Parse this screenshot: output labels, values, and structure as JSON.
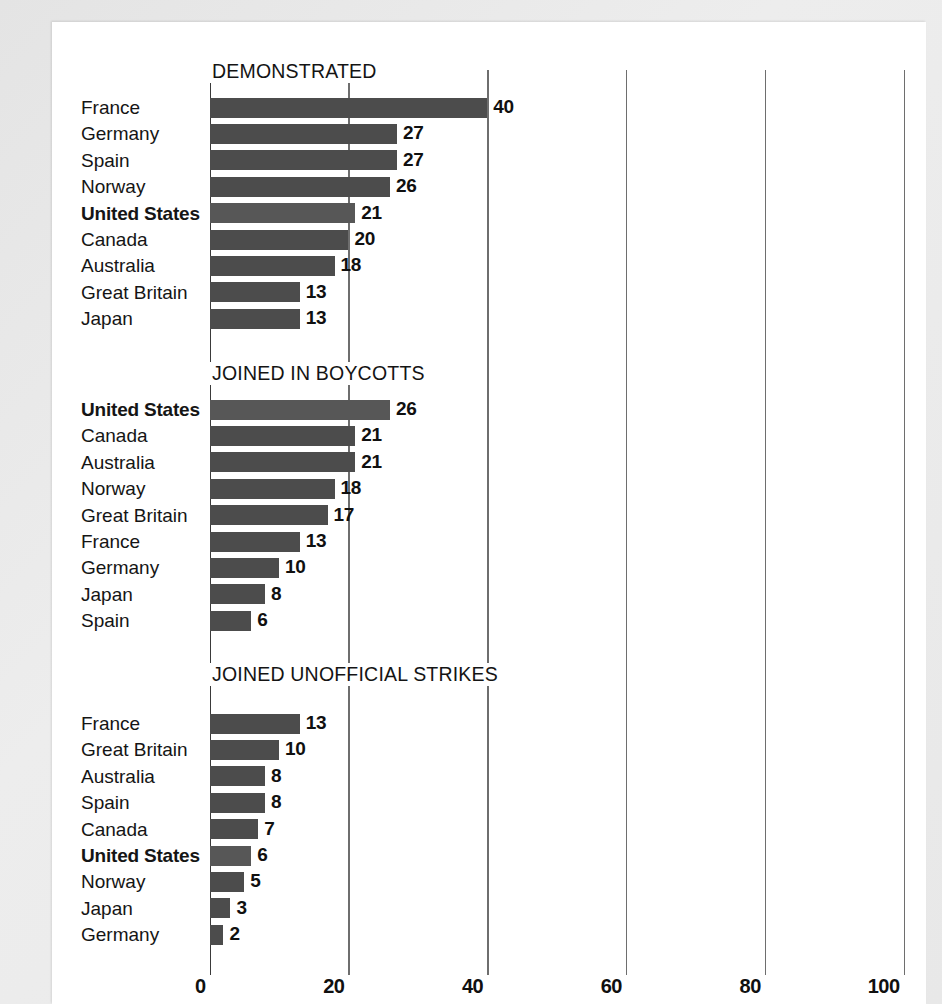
{
  "chart_data": {
    "type": "bar",
    "orientation": "horizontal",
    "title": "",
    "xlabel": "",
    "ylabel": "",
    "xlim": [
      0,
      100
    ],
    "xticks": [
      0,
      20,
      40,
      60,
      80,
      100
    ],
    "xtick_labels": [
      "0",
      "20",
      "40",
      "60",
      "80",
      "100"
    ],
    "grid": true,
    "legend": "none",
    "highlight_category": "United States",
    "bar_color": "#4c4c4c",
    "highlight_bar_color": "#575757",
    "panels": [
      {
        "title": "DEMONSTRATED",
        "categories": [
          "France",
          "Germany",
          "Spain",
          "Norway",
          "United States",
          "Canada",
          "Australia",
          "Great Britain",
          "Japan"
        ],
        "values": [
          40,
          27,
          27,
          26,
          21,
          20,
          18,
          13,
          13
        ]
      },
      {
        "title": "JOINED IN BOYCOTTS",
        "categories": [
          "United States",
          "Canada",
          "Australia",
          "Norway",
          "Great Britain",
          "France",
          "Germany",
          "Japan",
          "Spain"
        ],
        "values": [
          26,
          21,
          21,
          18,
          17,
          13,
          10,
          8,
          6
        ]
      },
      {
        "title": "JOINED UNOFFICIAL STRIKES",
        "categories": [
          "France",
          "Great Britain",
          "Australia",
          "Spain",
          "Canada",
          "United States",
          "Norway",
          "Japan",
          "Germany"
        ],
        "values": [
          13,
          10,
          8,
          8,
          7,
          6,
          5,
          3,
          2
        ]
      }
    ]
  }
}
